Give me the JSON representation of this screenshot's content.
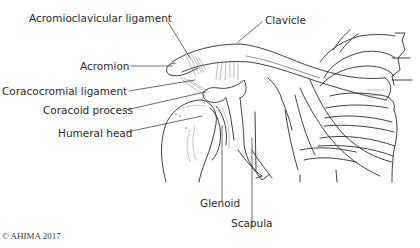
{
  "diagram": {
    "labels": [
      {
        "id": "acromioclavicular-ligament",
        "text": "Acromioclavicular ligament"
      },
      {
        "id": "clavicle",
        "text": "Clavicle"
      },
      {
        "id": "acromion",
        "text": "Acromion"
      },
      {
        "id": "coracocromial-ligament",
        "text": "Coracocromial ligament"
      },
      {
        "id": "coracoid-process",
        "text": "Coracoid process"
      },
      {
        "id": "humeral-head",
        "text": "Humeral head"
      },
      {
        "id": "glenoid",
        "text": "Glenoid"
      },
      {
        "id": "scapula",
        "text": "Scapula"
      }
    ],
    "copyright": "© AHIMA 2017"
  },
  "colors": {
    "line": "#2b2b2b",
    "shade": "#9a9a9a",
    "background": "#ffffff"
  }
}
